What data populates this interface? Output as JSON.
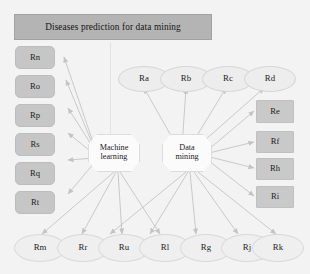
{
  "diagram": {
    "title": "Diseases prediction for data mining",
    "background_color": "#f3f3f3",
    "banner_color": "#b4b4b4",
    "box_color": "#c6c6c6",
    "oval_color": "#efefef",
    "octagon_color": "#fbfbfb",
    "edge_color": "#bcbcbc"
  },
  "center_nodes": [
    {
      "id": "ml",
      "line1": "Machine",
      "line2": "learning"
    },
    {
      "id": "dm",
      "line1": "Data",
      "line2": "mining"
    }
  ],
  "left_column": [
    {
      "label": "Rn"
    },
    {
      "label": "Ro"
    },
    {
      "label": "Rp"
    },
    {
      "label": "Rs"
    },
    {
      "label": "Rq"
    },
    {
      "label": "Rt"
    }
  ],
  "right_column": [
    {
      "label": "Re"
    },
    {
      "label": "Rf"
    },
    {
      "label": "Rh"
    },
    {
      "label": "Ri"
    }
  ],
  "top_ovals": [
    {
      "label": "Ra"
    },
    {
      "label": "Rb"
    },
    {
      "label": "Rc"
    },
    {
      "label": "Rd"
    }
  ],
  "bottom_ovals": [
    {
      "label": "Rm"
    },
    {
      "label": "Rr"
    },
    {
      "label": "Ru"
    },
    {
      "label": "Rl"
    },
    {
      "label": "Rg"
    },
    {
      "label": "Rj"
    },
    {
      "label": "Rk"
    }
  ]
}
